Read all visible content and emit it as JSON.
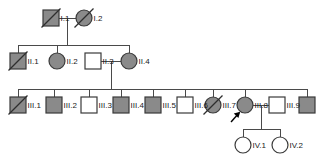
{
  "chart_data": {
    "type": "diagram",
    "diagram_type": "pedigree",
    "generations": [
      "I",
      "II",
      "III",
      "IV"
    ],
    "legend_semantics": {
      "square": "male",
      "circle": "female",
      "gray_fill": "affected",
      "white_fill": "unaffected",
      "diagonal_slash": "deceased",
      "arrow": "proband"
    },
    "individuals": [
      {
        "id": "I.1",
        "label": "I.1",
        "generation": "I",
        "sex": "male",
        "shape": "square",
        "affected": true,
        "deceased": true,
        "proband": false,
        "x": 51,
        "y": 18
      },
      {
        "id": "I.2",
        "label": "I.2",
        "generation": "I",
        "sex": "female",
        "shape": "circle",
        "affected": true,
        "deceased": true,
        "proband": false,
        "x": 84,
        "y": 18
      },
      {
        "id": "II.1",
        "label": "II.1",
        "generation": "II",
        "sex": "male",
        "shape": "square",
        "affected": true,
        "deceased": true,
        "proband": false,
        "x": 18,
        "y": 61
      },
      {
        "id": "II.2",
        "label": "II.2",
        "generation": "II",
        "sex": "female",
        "shape": "circle",
        "affected": true,
        "deceased": false,
        "proband": false,
        "x": 57,
        "y": 61
      },
      {
        "id": "II.3",
        "label": "II.3",
        "generation": "II",
        "sex": "male",
        "shape": "square",
        "affected": false,
        "deceased": false,
        "proband": false,
        "x": 93,
        "y": 61
      },
      {
        "id": "II.4",
        "label": "II.4",
        "generation": "II",
        "sex": "female",
        "shape": "circle",
        "affected": true,
        "deceased": false,
        "proband": false,
        "x": 129,
        "y": 61
      },
      {
        "id": "III.1",
        "label": "III.1",
        "generation": "III",
        "sex": "male",
        "shape": "square",
        "affected": true,
        "deceased": true,
        "proband": false,
        "x": 18,
        "y": 105
      },
      {
        "id": "III.2",
        "label": "III.2",
        "generation": "III",
        "sex": "male",
        "shape": "square",
        "affected": true,
        "deceased": false,
        "proband": false,
        "x": 54,
        "y": 105
      },
      {
        "id": "III.3",
        "label": "III.3",
        "generation": "III",
        "sex": "male",
        "shape": "square",
        "affected": false,
        "deceased": false,
        "proband": false,
        "x": 89,
        "y": 105
      },
      {
        "id": "III.4",
        "label": "III.4",
        "generation": "III",
        "sex": "male",
        "shape": "square",
        "affected": true,
        "deceased": false,
        "proband": false,
        "x": 121,
        "y": 105
      },
      {
        "id": "III.5",
        "label": "III.5",
        "generation": "III",
        "sex": "male",
        "shape": "square",
        "affected": true,
        "deceased": false,
        "proband": false,
        "x": 153,
        "y": 105
      },
      {
        "id": "III.6",
        "label": "III.6",
        "generation": "III",
        "sex": "male",
        "shape": "square",
        "affected": false,
        "deceased": false,
        "proband": false,
        "x": 185,
        "y": 105
      },
      {
        "id": "III.7",
        "label": "III.7",
        "generation": "III",
        "sex": "female",
        "shape": "circle",
        "affected": true,
        "deceased": true,
        "proband": false,
        "x": 213,
        "y": 105
      },
      {
        "id": "III.8",
        "label": "III.8",
        "generation": "III",
        "sex": "female",
        "shape": "circle",
        "affected": true,
        "deceased": false,
        "proband": true,
        "x": 245,
        "y": 105
      },
      {
        "id": "III.9",
        "label": "III.9",
        "generation": "III",
        "sex": "male",
        "shape": "square",
        "affected": false,
        "deceased": false,
        "proband": false,
        "x": 277,
        "y": 105
      },
      {
        "id": "III.10",
        "label": "",
        "generation": "III",
        "sex": "male",
        "shape": "square",
        "affected": true,
        "deceased": false,
        "proband": false,
        "x": 307,
        "y": 105
      },
      {
        "id": "IV.1",
        "label": "IV.1",
        "generation": "IV",
        "sex": "female",
        "shape": "circle",
        "affected": false,
        "deceased": false,
        "proband": false,
        "x": 243,
        "y": 145
      },
      {
        "id": "IV.2",
        "label": "IV.2",
        "generation": "IV",
        "sex": "female",
        "shape": "circle",
        "affected": false,
        "deceased": false,
        "proband": false,
        "x": 280,
        "y": 145
      }
    ],
    "matings": [
      {
        "partners": [
          "I.1",
          "I.2"
        ],
        "children": [
          "II.1",
          "II.2",
          "II.4"
        ]
      },
      {
        "partners": [
          "II.3",
          "II.4"
        ],
        "children": [
          "III.1",
          "III.2",
          "III.3",
          "III.4",
          "III.5",
          "III.6",
          "III.7",
          "III.8",
          "III.10"
        ]
      },
      {
        "partners": [
          "III.8",
          "III.9"
        ],
        "children": [
          "IV.1",
          "IV.2"
        ]
      }
    ],
    "counts": {
      "total_individuals": 18,
      "affected": 11,
      "deceased": 5,
      "generations": 4
    }
  },
  "symbol_colors": {
    "affected_fill": "#8a8a8a",
    "unaffected_fill": "#ffffff",
    "outline": "#3a3a3a",
    "connector_line": "#4a4a4a",
    "label_text": "#1a1a1a",
    "proband_arrow": "#000000",
    "background": "#ffffff"
  },
  "geometry": {
    "square_size": 16,
    "circle_radius": 8,
    "label_offset_x": 10,
    "gen1_y": 18,
    "gen2_y": 61,
    "gen3_y": 105,
    "gen4_y": 145
  }
}
